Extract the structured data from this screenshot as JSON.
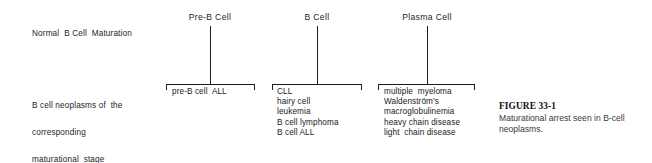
{
  "figure": {
    "background_color": "#ffffff",
    "ink_color": "#1d1d1d",
    "row_labels": {
      "maturation": {
        "lines": [
          "Normal  B Cell  Maturation"
        ]
      },
      "neoplasms": {
        "lines": [
          "B cell neoplasms of  the",
          "corresponding",
          "maturational  stage"
        ]
      }
    },
    "stages": [
      {
        "id": "pre-b-cell",
        "header": "Pre-B Cell",
        "neoplasms": [
          "pre-B cell  ALL"
        ]
      },
      {
        "id": "b-cell",
        "header": "B Cell",
        "neoplasms": [
          "CLL",
          "hairy cell",
          "leukemia",
          "B cell lymphoma",
          "B cell ALL"
        ]
      },
      {
        "id": "plasma-cell",
        "header": "Plasma Cell",
        "neoplasms": [
          "multiple  myeloma",
          "Waldenström's",
          "macroglobulinemia",
          "heavy chain disease",
          "light  chain disease"
        ]
      }
    ],
    "caption": {
      "title": "FIGURE 33-1",
      "body": "Maturational arrest seen in B-cell neoplasms."
    }
  }
}
